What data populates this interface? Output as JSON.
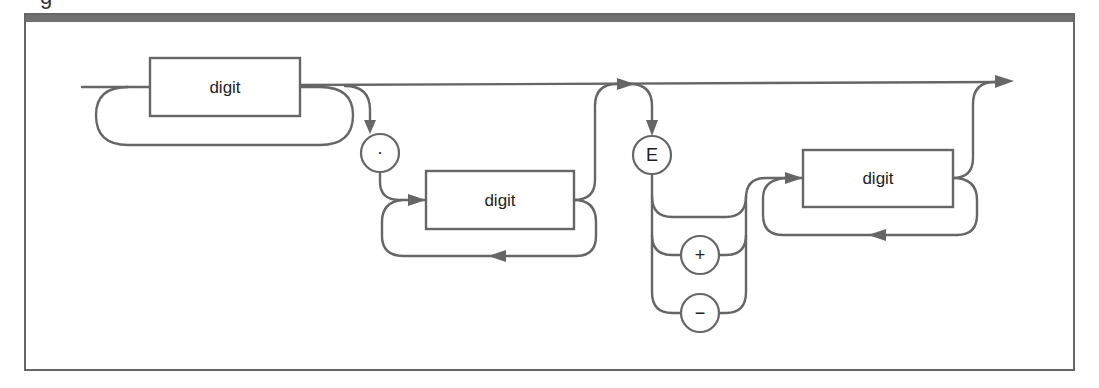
{
  "figure": {
    "caption_fragment": "g"
  },
  "colors": {
    "stroke": "#666666",
    "header_bar": "#707070",
    "text": "#222222",
    "background": "#ffffff"
  },
  "nodes": {
    "digit_integer": {
      "label": "digit",
      "kind": "nonterminal"
    },
    "decimal_point": {
      "label": "·",
      "kind": "terminal"
    },
    "digit_fraction": {
      "label": "digit",
      "kind": "nonterminal"
    },
    "exponent_e": {
      "label": "E",
      "kind": "terminal"
    },
    "sign_plus": {
      "label": "+",
      "kind": "terminal"
    },
    "sign_minus": {
      "label": "−",
      "kind": "terminal"
    },
    "digit_exponent": {
      "label": "digit",
      "kind": "nonterminal"
    }
  },
  "edges": [
    {
      "from": "entry",
      "to": "digit_integer"
    },
    {
      "from": "digit_integer",
      "to": "digit_integer",
      "type": "repeat-loop"
    },
    {
      "from": "digit_integer",
      "to": "decimal_point"
    },
    {
      "from": "digit_integer",
      "to": "exponent_e",
      "type": "bypass"
    },
    {
      "from": "digit_integer",
      "to": "exit",
      "type": "bypass"
    },
    {
      "from": "decimal_point",
      "to": "digit_fraction"
    },
    {
      "from": "digit_fraction",
      "to": "digit_fraction",
      "type": "repeat-loop"
    },
    {
      "from": "digit_fraction",
      "to": "exponent_e"
    },
    {
      "from": "digit_fraction",
      "to": "exit"
    },
    {
      "from": "exponent_e",
      "to": "sign_plus"
    },
    {
      "from": "exponent_e",
      "to": "sign_minus"
    },
    {
      "from": "exponent_e",
      "to": "digit_exponent",
      "type": "no-sign"
    },
    {
      "from": "sign_plus",
      "to": "digit_exponent"
    },
    {
      "from": "sign_minus",
      "to": "digit_exponent"
    },
    {
      "from": "digit_exponent",
      "to": "digit_exponent",
      "type": "repeat-loop"
    },
    {
      "from": "digit_exponent",
      "to": "exit"
    }
  ]
}
